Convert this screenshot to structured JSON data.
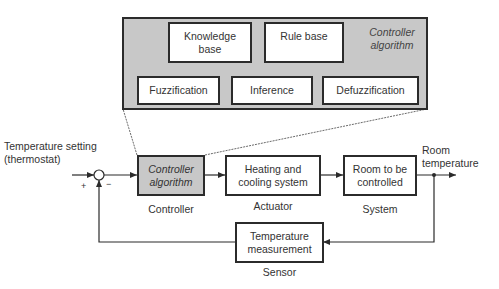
{
  "controller_algorithm_detail": {
    "title": "Controller algorithm",
    "knowledge_base": "Knowledge base",
    "rule_base": "Rule base",
    "fuzzification": "Fuzzification",
    "inference": "Inference",
    "defuzzification": "Defuzzification"
  },
  "loop": {
    "input_label_line1": "Temperature setting",
    "input_label_line2": "(thermostat)",
    "plus_sign": "+",
    "minus_sign": "−",
    "controller_box": "Controller algorithm",
    "controller_caption": "Controller",
    "actuator_box": "Heating and cooling system",
    "actuator_caption": "Actuator",
    "system_box": "Room to be controlled",
    "system_caption": "System",
    "output_label_line1": "Room",
    "output_label_line2": "temperature",
    "sensor_box": "Temperature measurement",
    "sensor_caption": "Sensor"
  },
  "colors": {
    "block_fill": "#ffffff",
    "highlight_fill": "#c8c8c8",
    "line": "#2b2b2b"
  }
}
